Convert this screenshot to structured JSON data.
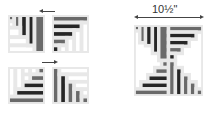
{
  "diagram": {
    "type": "quilt-block-assembly",
    "colors": {
      "white": "#ffffff",
      "gray": "#6a6a6a",
      "dark": "#262626",
      "border": "#3a3a3a"
    },
    "dimension_label": "10½\"",
    "units": [
      {
        "name": "top-left-unit",
        "rects": [
          [
            0,
            0,
            1,
            1,
            "gray"
          ],
          [
            0,
            1,
            1,
            1,
            "white"
          ],
          [
            1,
            0,
            1,
            3,
            "gray"
          ],
          [
            2,
            0,
            1,
            4,
            "dark"
          ],
          [
            3,
            0,
            1,
            5,
            "gray"
          ],
          [
            0,
            2,
            2,
            1,
            "white"
          ],
          [
            0,
            3,
            3,
            1,
            "white"
          ],
          [
            0,
            4,
            3,
            1,
            "white"
          ],
          [
            0,
            5,
            4,
            1,
            "white"
          ],
          [
            4,
            0,
            1,
            6,
            "gray"
          ],
          [
            5,
            0,
            1,
            6,
            "gray"
          ]
        ]
      },
      {
        "name": "top-right-unit",
        "rects": [
          [
            0,
            0,
            6,
            1,
            "gray"
          ],
          [
            0,
            1,
            5,
            1,
            "dark"
          ],
          [
            0,
            2,
            4,
            1,
            "dark"
          ],
          [
            0,
            3,
            3,
            1,
            "gray"
          ],
          [
            0,
            4,
            1,
            2,
            "dark"
          ],
          [
            1,
            4,
            1,
            2,
            "white"
          ],
          [
            2,
            3,
            1,
            3,
            "white"
          ],
          [
            3,
            2,
            1,
            4,
            "white"
          ],
          [
            4,
            1,
            1,
            5,
            "white"
          ],
          [
            5,
            1,
            1,
            5,
            "white"
          ]
        ]
      },
      {
        "name": "bottom-left-unit",
        "rects": [
          [
            0,
            0,
            1,
            4,
            "white"
          ],
          [
            1,
            0,
            1,
            4,
            "white"
          ],
          [
            2,
            0,
            1,
            1,
            "white"
          ],
          [
            3,
            0,
            1,
            1,
            "white"
          ],
          [
            4,
            0,
            2,
            1,
            "gray"
          ],
          [
            2,
            1,
            1,
            2,
            "white"
          ],
          [
            3,
            1,
            3,
            1,
            "gray"
          ],
          [
            3,
            2,
            3,
            1,
            "gray"
          ],
          [
            2,
            3,
            4,
            1,
            "dark"
          ],
          [
            1,
            4,
            5,
            1,
            "dark"
          ],
          [
            0,
            5,
            6,
            1,
            "gray"
          ]
        ]
      },
      {
        "name": "bottom-right-unit",
        "rects": [
          [
            0,
            0,
            1,
            6,
            "gray"
          ],
          [
            1,
            0,
            5,
            1,
            "white"
          ],
          [
            1,
            1,
            1,
            5,
            "dark"
          ],
          [
            2,
            1,
            4,
            1,
            "white"
          ],
          [
            2,
            2,
            1,
            4,
            "gray"
          ],
          [
            3,
            2,
            3,
            1,
            "white"
          ],
          [
            3,
            3,
            1,
            3,
            "gray"
          ],
          [
            4,
            3,
            2,
            1,
            "white"
          ],
          [
            4,
            4,
            1,
            2,
            "gray"
          ],
          [
            5,
            4,
            1,
            2,
            "gray"
          ]
        ]
      }
    ]
  }
}
